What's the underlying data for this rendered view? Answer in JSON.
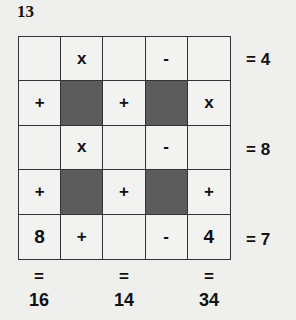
{
  "puzzle_number": "13",
  "grid": [
    [
      {
        "v": "",
        "t": "blank"
      },
      {
        "v": "x",
        "t": "op"
      },
      {
        "v": "",
        "t": "blank"
      },
      {
        "v": "-",
        "t": "op"
      },
      {
        "v": "",
        "t": "blank"
      }
    ],
    [
      {
        "v": "+",
        "t": "op"
      },
      {
        "v": "",
        "t": "dark"
      },
      {
        "v": "+",
        "t": "op"
      },
      {
        "v": "",
        "t": "dark"
      },
      {
        "v": "x",
        "t": "op"
      }
    ],
    [
      {
        "v": "",
        "t": "blank"
      },
      {
        "v": "x",
        "t": "op"
      },
      {
        "v": "",
        "t": "blank"
      },
      {
        "v": "-",
        "t": "op"
      },
      {
        "v": "",
        "t": "blank"
      }
    ],
    [
      {
        "v": "+",
        "t": "op"
      },
      {
        "v": "",
        "t": "dark"
      },
      {
        "v": "+",
        "t": "op"
      },
      {
        "v": "",
        "t": "dark"
      },
      {
        "v": "+",
        "t": "op"
      }
    ],
    [
      {
        "v": "8",
        "t": "num"
      },
      {
        "v": "+",
        "t": "op"
      },
      {
        "v": "",
        "t": "blank"
      },
      {
        "v": "-",
        "t": "op"
      },
      {
        "v": "4",
        "t": "num"
      }
    ]
  ],
  "row_results": [
    "= 4",
    "= 8",
    "= 7"
  ],
  "col_results": [
    {
      "eq": "=",
      "value": "16"
    },
    {
      "eq": "=",
      "value": "14"
    },
    {
      "eq": "=",
      "value": "34"
    }
  ],
  "colors": {
    "dark_cell": "#5c5c5c",
    "background": "#efefed",
    "line": "#333333"
  }
}
